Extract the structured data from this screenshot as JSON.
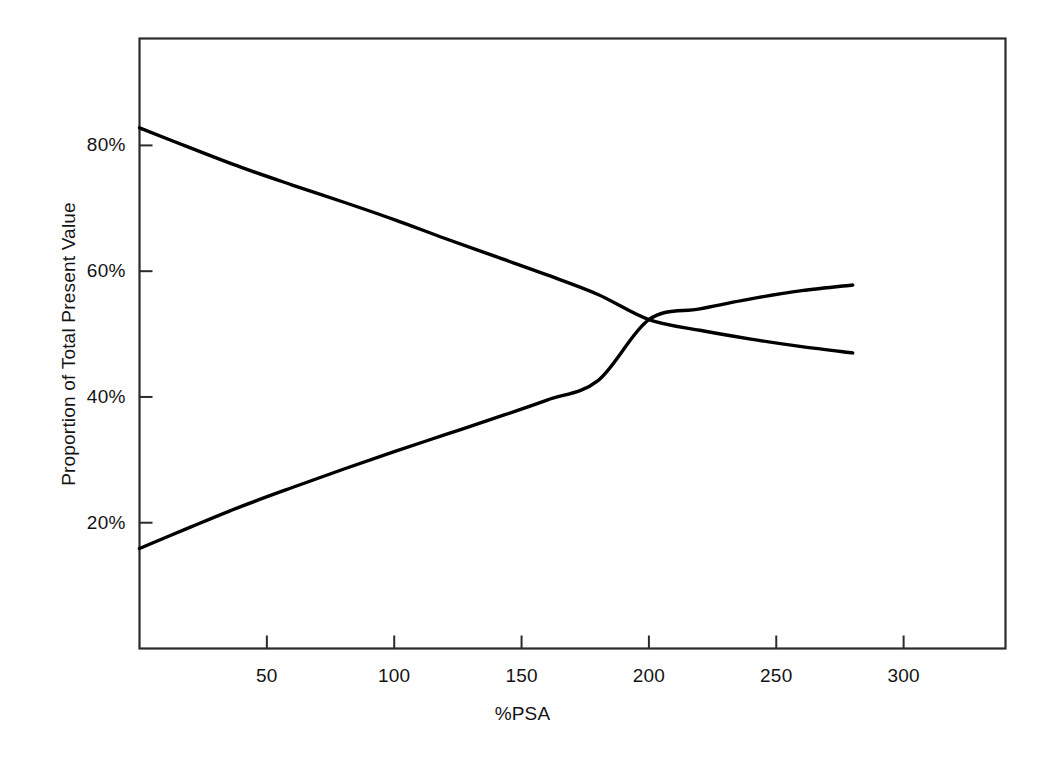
{
  "chart_data": {
    "type": "line",
    "title": "",
    "xlabel": "%PSA",
    "ylabel": "Proportion of Total Present Value",
    "xlim": [
      0,
      340
    ],
    "ylim": [
      0,
      97
    ],
    "grid": false,
    "legend": "none",
    "xticks": [
      50,
      100,
      150,
      200,
      250,
      300
    ],
    "xtick_labels": [
      "50",
      "100",
      "150",
      "200",
      "250",
      "300"
    ],
    "yticks": [
      20,
      40,
      60,
      80
    ],
    "ytick_labels": [
      "20%",
      "40%",
      "60%",
      "80%"
    ],
    "series": [
      {
        "name": "descending-curve",
        "color": "#000000",
        "x": [
          0,
          20,
          40,
          60,
          80,
          100,
          120,
          140,
          160,
          180,
          200,
          220,
          240,
          260,
          280
        ],
        "y": [
          82.8,
          79.6,
          76.5,
          73.7,
          71.0,
          68.2,
          65.2,
          62.3,
          59.4,
          56.3,
          52.3,
          50.6,
          49.2,
          48.0,
          47.0
        ]
      },
      {
        "name": "ascending-curve",
        "color": "#000000",
        "x": [
          0,
          20,
          40,
          60,
          80,
          100,
          120,
          140,
          160,
          180,
          200,
          220,
          240,
          260,
          280
        ],
        "y": [
          15.9,
          19.3,
          22.6,
          25.6,
          28.5,
          31.3,
          34.0,
          36.7,
          39.5,
          42.6,
          52.3,
          54.0,
          55.6,
          56.9,
          57.8
        ]
      }
    ],
    "crossover": {
      "x": 200,
      "y": 52.3
    }
  },
  "axes": {
    "x_axis_name": "%PSA",
    "y_axis_name": "Proportion of Total Present Value"
  }
}
